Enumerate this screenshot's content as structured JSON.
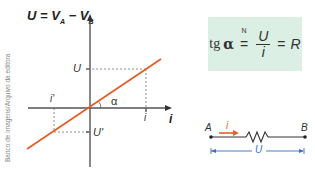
{
  "credit": "Banco de imagens/Arquivo da editora",
  "graph": {
    "y_axis_label": {
      "U": "U",
      "eq": "=",
      "VA": "V",
      "A": "A",
      "minus": "−",
      "VB": "V",
      "B": "B"
    },
    "x_axis_label": "i",
    "tick_U": "U",
    "tick_i": "i",
    "tick_U_prime": "U'",
    "tick_i_prime": "i'",
    "angle_label": "α",
    "line_color": "#e0602a",
    "axis_color": "#555555"
  },
  "formula": {
    "lhs_tg": "tg",
    "lhs_alpha": "α",
    "numeric_eq_symbol": "=",
    "numeric_eq_superscript": "N",
    "numerator": "U",
    "denominator": "i",
    "eq": "=",
    "rhs": "R",
    "background": "#dcefe4"
  },
  "circuit": {
    "node_a": "A",
    "node_b": "B",
    "current_label": "i",
    "voltage_label": "U",
    "current_arrow_color": "#e0602a",
    "voltage_line_color": "#3a6fc9"
  }
}
